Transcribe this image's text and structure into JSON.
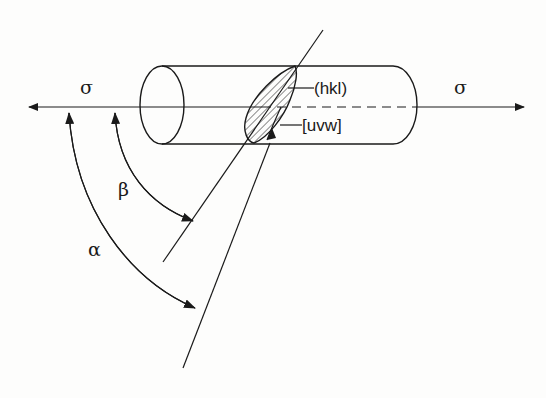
{
  "figure": {
    "colors": {
      "ink": "#1a1a1a",
      "background": "#fdfdfc"
    }
  },
  "labels": {
    "stress_left": "σ",
    "stress_right": "σ",
    "slip_plane": "(hkl)",
    "slip_direction": "[uvw]",
    "angle_beta": "β",
    "angle_alpha": "α"
  },
  "geometry": {
    "axis": {
      "y": 107,
      "x_start": 28,
      "x_end": 525
    },
    "cylinder": {
      "top": 66,
      "bottom": 144,
      "left_cx": 148,
      "right_x": 417
    },
    "slip_plane_normal": {
      "from": [
        323,
        30
      ],
      "to": [
        163,
        262
      ]
    },
    "slip_direction_line": {
      "from": [
        270,
        143
      ],
      "to": [
        183,
        368
      ]
    }
  }
}
